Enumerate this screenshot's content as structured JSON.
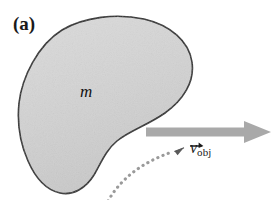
{
  "figure": {
    "panel_label": "(a)",
    "mass_label": "m",
    "velocity": {
      "symbol": "v",
      "subscript": "obj",
      "has_vector_arrow": true
    },
    "colors": {
      "blob_fill": "#d2d2d2",
      "blob_stroke": "#262626",
      "motion_arrow": "#a9a9a9",
      "dotted_curve": "#9a9a9a",
      "text": "#1a1a1a",
      "background": "#ffffff"
    },
    "elements": {
      "blob_name": "irregular-object-blob",
      "motion_arrow_name": "velocity-arrow",
      "dotted_curve_name": "dotted-leader-curve"
    }
  }
}
